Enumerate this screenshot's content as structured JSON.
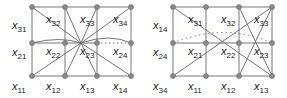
{
  "figure": {
    "left_panel": {
      "labels": {
        "row_left": [
          "x31",
          "x21",
          "x11"
        ],
        "bottom": [
          "x12",
          "x13",
          "x14"
        ],
        "inner_top": [
          "x32",
          "x33",
          "x34"
        ],
        "inner_mid": [
          "x22",
          "x23",
          "x24"
        ]
      }
    },
    "right_panel": {
      "labels": {
        "row_left": [
          "x14",
          "x24",
          "x34"
        ],
        "bottom": [
          "x11",
          "x12",
          "x13"
        ],
        "inner_top": [
          "x31",
          "x32",
          "x33"
        ],
        "inner_mid": [
          "x21",
          "x22",
          "x23"
        ]
      }
    },
    "colors": {
      "node": "#8a8a8a",
      "line": "#555555"
    }
  }
}
